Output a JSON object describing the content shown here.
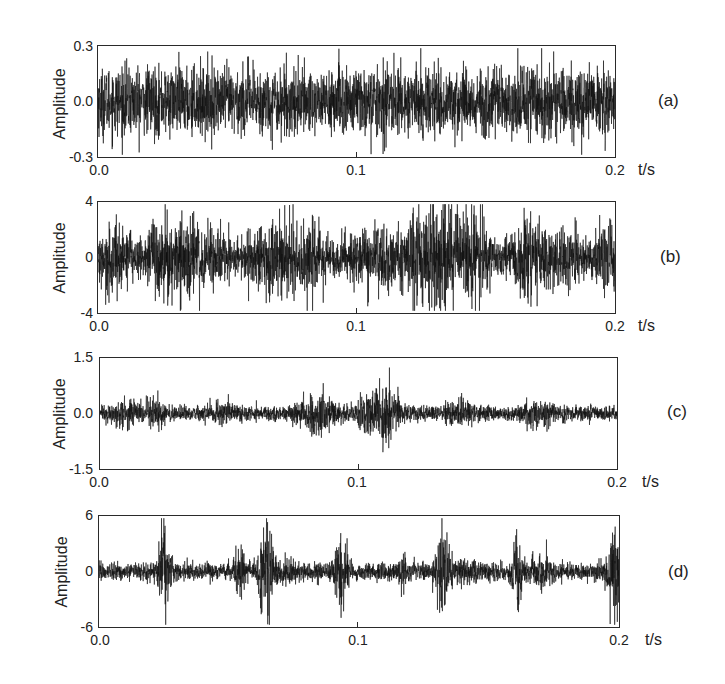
{
  "chart_data": [
    {
      "type": "line",
      "panel_label": "(a)",
      "title": "",
      "xlabel": "t/s",
      "ylabel": "Amplitude",
      "xlim": [
        0.0,
        0.2
      ],
      "ylim": [
        -0.3,
        0.3
      ],
      "x_ticks": [
        "0.0",
        "0.1",
        "0.2"
      ],
      "y_ticks": [
        "0.3",
        "0.0",
        "-0.3"
      ],
      "grid": false,
      "description": "Stationary broadband noise, roughly ±0.15 with peaks up to ±0.2",
      "envelope": {
        "base": 0.09,
        "bursts": []
      },
      "peak_amplitude": 0.2
    },
    {
      "type": "line",
      "panel_label": "(b)",
      "title": "",
      "xlabel": "t/s",
      "ylabel": "Amplitude",
      "xlim": [
        0.0,
        0.2
      ],
      "ylim": [
        -4,
        4
      ],
      "x_ticks": [
        "0.0",
        "0.1",
        "0.2"
      ],
      "y_ticks": [
        "4",
        "0",
        "-4"
      ],
      "grid": false,
      "description": "Amplitude-modulated bursts with quiet gaps, peak ≈ 3.4 near t≈0.133",
      "envelope": {
        "base": 0.08,
        "bursts": [
          {
            "t": 0.006,
            "w": 0.006,
            "a": 1.4
          },
          {
            "t": 0.026,
            "w": 0.005,
            "a": 1.2
          },
          {
            "t": 0.04,
            "w": 0.009,
            "a": 1.2
          },
          {
            "t": 0.066,
            "w": 0.006,
            "a": 1.3
          },
          {
            "t": 0.081,
            "w": 0.006,
            "a": 1.4
          },
          {
            "t": 0.1,
            "w": 0.005,
            "a": 0.9
          },
          {
            "t": 0.113,
            "w": 0.006,
            "a": 1.1
          },
          {
            "t": 0.125,
            "w": 0.004,
            "a": 1.6
          },
          {
            "t": 0.134,
            "w": 0.004,
            "a": 2.2
          },
          {
            "t": 0.146,
            "w": 0.004,
            "a": 1.8
          },
          {
            "t": 0.165,
            "w": 0.006,
            "a": 1.3
          },
          {
            "t": 0.18,
            "w": 0.007,
            "a": 1.0
          },
          {
            "t": 0.198,
            "w": 0.004,
            "a": 1.3
          }
        ]
      },
      "peak_amplitude": 3.4
    },
    {
      "type": "line",
      "panel_label": "(c)",
      "title": "",
      "xlabel": "t/s",
      "ylabel": "Amplitude",
      "xlim": [
        0.0,
        0.2
      ],
      "ylim": [
        -1.5,
        1.5
      ],
      "x_ticks": [
        "0.0",
        "0.1",
        "0.2"
      ],
      "y_ticks": [
        "1.5",
        "0.0",
        "-1.5"
      ],
      "grid": false,
      "description": "Low-level modulated noise ~±0.3, strongest event ≈ 1.0 near t≈0.11",
      "envelope": {
        "base": 0.12,
        "bursts": [
          {
            "t": 0.01,
            "w": 0.004,
            "a": 0.12
          },
          {
            "t": 0.022,
            "w": 0.004,
            "a": 0.12
          },
          {
            "t": 0.047,
            "w": 0.004,
            "a": 0.1
          },
          {
            "t": 0.084,
            "w": 0.005,
            "a": 0.22
          },
          {
            "t": 0.104,
            "w": 0.003,
            "a": 0.25
          },
          {
            "t": 0.111,
            "w": 0.003,
            "a": 0.45
          },
          {
            "t": 0.14,
            "w": 0.004,
            "a": 0.12
          },
          {
            "t": 0.17,
            "w": 0.004,
            "a": 0.12
          }
        ]
      },
      "peak_amplitude": 1.0
    },
    {
      "type": "line",
      "panel_label": "(d)",
      "title": "",
      "xlabel": "t/s",
      "ylabel": "Amplitude",
      "xlim": [
        0.0,
        0.2
      ],
      "ylim": [
        -6,
        6
      ],
      "x_ticks": [
        "0.0",
        "0.1",
        "0.2"
      ],
      "y_ticks": [
        "6",
        "0",
        "-6"
      ],
      "grid": false,
      "description": "Impulsive transient bursts on a low baseline; peaks ≈ 4.8 at t≈0.064, ≈4.3 at t≈0.132",
      "envelope": {
        "base": 0.12,
        "bursts": [
          {
            "t": 0.025,
            "w": 0.0015,
            "a": 2.8
          },
          {
            "t": 0.054,
            "w": 0.0012,
            "a": 1.6
          },
          {
            "t": 0.064,
            "w": 0.0015,
            "a": 3.3
          },
          {
            "t": 0.07,
            "w": 0.003,
            "a": 0.5
          },
          {
            "t": 0.093,
            "w": 0.0015,
            "a": 2.4
          },
          {
            "t": 0.117,
            "w": 0.001,
            "a": 0.5
          },
          {
            "t": 0.132,
            "w": 0.0016,
            "a": 3.0
          },
          {
            "t": 0.14,
            "w": 0.003,
            "a": 0.4
          },
          {
            "t": 0.161,
            "w": 0.0013,
            "a": 2.2
          },
          {
            "t": 0.17,
            "w": 0.003,
            "a": 0.6
          },
          {
            "t": 0.198,
            "w": 0.0014,
            "a": 3.0
          }
        ]
      },
      "peak_amplitude": 4.8
    }
  ],
  "colors": {
    "line": "#111111",
    "frame": "#2a2a2a",
    "text": "#222222",
    "background": "#ffffff"
  }
}
